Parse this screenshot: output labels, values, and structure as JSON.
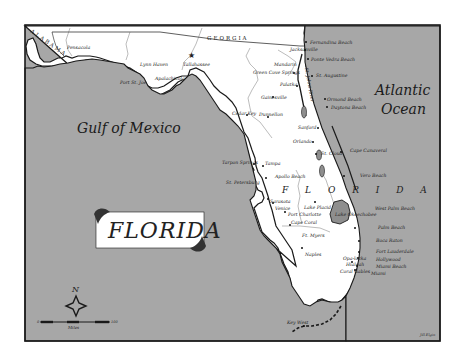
{
  "map": {
    "title": "FLORIDA",
    "state_label": "F L O R I D A",
    "colors": {
      "water": "#a7a7a7",
      "land": "#ffffff",
      "border": "#1a1a1a",
      "lake": "#8e8e8e",
      "page": "#ffffff"
    },
    "water_bodies": {
      "gulf": "Gulf of Mexico",
      "atlantic_1": "Atlantic",
      "atlantic_2": "Ocean"
    },
    "neighbor_states": {
      "alabama": "ALABAMA",
      "georgia": "GEORGIA"
    },
    "capital": "Tallahassee",
    "cities": [
      {
        "name": "Pensacola"
      },
      {
        "name": "Lynn Haven"
      },
      {
        "name": "Port St. Joe"
      },
      {
        "name": "Apalachicola"
      },
      {
        "name": "Tallahassee"
      },
      {
        "name": "Fernandina Beach"
      },
      {
        "name": "Jacksonville"
      },
      {
        "name": "Ponte Vedra Beach"
      },
      {
        "name": "Mandarin"
      },
      {
        "name": "Green Cove Springs"
      },
      {
        "name": "St. Augustine"
      },
      {
        "name": "Palatka"
      },
      {
        "name": "Gainesville"
      },
      {
        "name": "Ormond Beach"
      },
      {
        "name": "Daytona Beach"
      },
      {
        "name": "Cedar Key"
      },
      {
        "name": "Dunnellon"
      },
      {
        "name": "Sanford"
      },
      {
        "name": "Orlando"
      },
      {
        "name": "St. Cloud"
      },
      {
        "name": "Cape Canaveral"
      },
      {
        "name": "Tarpon Springs"
      },
      {
        "name": "Tampa"
      },
      {
        "name": "Apollo Beach"
      },
      {
        "name": "St. Petersburg"
      },
      {
        "name": "Vero Beach"
      },
      {
        "name": "Sarasota"
      },
      {
        "name": "Venice"
      },
      {
        "name": "Lake Placid"
      },
      {
        "name": "Port Charlotte"
      },
      {
        "name": "Lake Okeechobee"
      },
      {
        "name": "West Palm Beach"
      },
      {
        "name": "Cape Coral"
      },
      {
        "name": "Ft. Myers"
      },
      {
        "name": "Palm Beach"
      },
      {
        "name": "Boca Raton"
      },
      {
        "name": "Fort Lauderdale"
      },
      {
        "name": "Naples"
      },
      {
        "name": "Opa-locka"
      },
      {
        "name": "Hialeah"
      },
      {
        "name": "Hollywood"
      },
      {
        "name": "Miami Beach"
      },
      {
        "name": "Coral Gables"
      },
      {
        "name": "Miami"
      },
      {
        "name": "Key West"
      }
    ],
    "river": "St. Johns River",
    "compass": {
      "label": "N"
    },
    "scale_bar": {
      "start": "0",
      "end": "100",
      "unit": "Miles"
    },
    "credit": "Jill Elgin"
  }
}
